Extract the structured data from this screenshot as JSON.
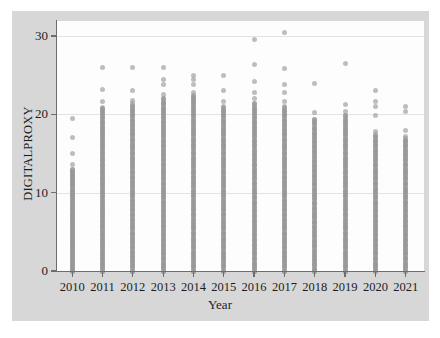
{
  "chart_data": {
    "type": "scatter",
    "title": "",
    "xlabel": "Year",
    "ylabel": "DIGITALPROXY",
    "xlim": [
      2009.5,
      2021.6
    ],
    "ylim": [
      -1.2,
      32.5
    ],
    "grid": true,
    "gridlines_y": [
      10,
      20,
      30
    ],
    "legend": "none",
    "x_tick_labels": [
      "2010",
      "2011",
      "2012",
      "2013",
      "2014",
      "2015",
      "2016",
      "2017",
      "2018",
      "2019",
      "2020",
      "2021"
    ],
    "y_tick_labels": [
      "0",
      "10",
      "20",
      "30"
    ],
    "y_ticks": [
      0,
      10,
      20,
      30
    ],
    "marker": {
      "shape": "circle",
      "color": "#969696",
      "opacity": 0.62,
      "size_px": 5
    },
    "background": {
      "figure": "#d7d7d7",
      "plot": "#fdfdfd",
      "axis": "#6d6d6d",
      "grid": "#e3e3e3"
    },
    "series": [
      {
        "name": "2010",
        "x": 2010,
        "dense_range": [
          0,
          13.0
        ],
        "values": [
          19.5,
          17.0,
          15.0,
          13.6,
          13.0,
          12.6,
          12.2,
          11.8,
          11.4,
          11.0,
          10.6,
          10.2,
          9.8,
          9.4,
          9.0,
          8.6,
          8.2,
          7.8,
          7.4,
          7.0,
          6.6,
          6.2,
          5.8,
          5.4,
          5.0,
          4.6,
          4.2,
          3.8,
          3.4,
          3.0,
          2.6,
          2.2,
          1.8,
          1.4,
          1.0,
          0.6,
          0.2,
          0.0
        ]
      },
      {
        "name": "2011",
        "x": 2011,
        "dense_range": [
          0,
          21.0
        ],
        "values": [
          26.0,
          23.2,
          21.6,
          20.8,
          20.2,
          19.6,
          19.0,
          18.5,
          18.0,
          17.5,
          17.0,
          16.5,
          16.0,
          15.5,
          15.0,
          14.5,
          14.0,
          13.5,
          13.0,
          12.5,
          12.0,
          11.5,
          11.0,
          10.5,
          10.0,
          9.5,
          9.0,
          8.5,
          8.0,
          7.5,
          7.0,
          6.5,
          6.0,
          5.5,
          5.0,
          4.5,
          4.0,
          3.5,
          3.0,
          2.5,
          2.0,
          1.5,
          1.0,
          0.5,
          0.0
        ]
      },
      {
        "name": "2012",
        "x": 2012,
        "dense_range": [
          0,
          21.5
        ],
        "values": [
          26.0,
          23.0,
          21.8,
          21.0,
          20.4,
          19.8,
          19.2,
          18.6,
          18.0,
          17.4,
          16.8,
          16.2,
          15.6,
          15.0,
          14.4,
          13.8,
          13.2,
          12.6,
          12.0,
          11.4,
          10.8,
          10.2,
          9.6,
          9.0,
          8.4,
          7.8,
          7.2,
          6.6,
          6.0,
          5.4,
          4.8,
          4.2,
          3.6,
          3.0,
          2.4,
          1.8,
          1.2,
          0.6,
          0.0
        ]
      },
      {
        "name": "2013",
        "x": 2013,
        "dense_range": [
          0,
          22.0
        ],
        "values": [
          26.0,
          24.4,
          23.8,
          22.6,
          22.0,
          21.4,
          20.8,
          20.2,
          19.6,
          19.0,
          18.4,
          17.8,
          17.2,
          16.6,
          16.0,
          15.4,
          14.8,
          14.2,
          13.6,
          13.0,
          12.4,
          11.8,
          11.2,
          10.6,
          10.0,
          9.4,
          8.8,
          8.2,
          7.6,
          7.0,
          6.4,
          5.8,
          5.2,
          4.6,
          4.0,
          3.4,
          2.8,
          2.2,
          1.6,
          1.0,
          0.4,
          0.0
        ]
      },
      {
        "name": "2014",
        "x": 2014,
        "dense_range": [
          0,
          22.5
        ],
        "values": [
          25.0,
          24.4,
          23.8,
          22.8,
          22.2,
          21.6,
          21.0,
          20.4,
          19.8,
          19.2,
          18.6,
          18.0,
          17.4,
          16.8,
          16.2,
          15.6,
          15.0,
          14.4,
          13.8,
          13.2,
          12.6,
          12.0,
          11.4,
          10.8,
          10.2,
          9.6,
          9.0,
          8.4,
          7.8,
          7.2,
          6.6,
          6.0,
          5.4,
          4.8,
          4.2,
          3.6,
          3.0,
          2.4,
          1.8,
          1.2,
          0.6,
          0.0
        ]
      },
      {
        "name": "2015",
        "x": 2015,
        "dense_range": [
          0,
          21.0
        ],
        "values": [
          25.0,
          23.0,
          21.6,
          21.0,
          20.4,
          19.8,
          19.2,
          18.6,
          18.0,
          17.4,
          16.8,
          16.2,
          15.6,
          15.0,
          14.4,
          13.8,
          13.2,
          12.6,
          12.0,
          11.4,
          10.8,
          10.2,
          9.6,
          9.0,
          8.4,
          7.8,
          7.2,
          6.6,
          6.0,
          5.4,
          4.8,
          4.2,
          3.6,
          3.0,
          2.4,
          1.8,
          1.2,
          0.6,
          0.0
        ]
      },
      {
        "name": "2016",
        "x": 2016,
        "dense_range": [
          0,
          21.5
        ],
        "values": [
          29.5,
          26.4,
          24.2,
          22.8,
          22.0,
          21.4,
          20.8,
          20.2,
          19.6,
          19.0,
          18.4,
          17.8,
          17.2,
          16.6,
          16.0,
          15.4,
          14.8,
          14.2,
          13.6,
          13.0,
          12.4,
          11.8,
          11.2,
          10.6,
          10.0,
          9.4,
          8.8,
          8.2,
          7.6,
          7.0,
          6.4,
          5.8,
          5.2,
          4.6,
          4.0,
          3.4,
          2.8,
          2.2,
          1.6,
          1.0,
          0.4,
          0.0
        ]
      },
      {
        "name": "2017",
        "x": 2017,
        "dense_range": [
          0,
          21.0
        ],
        "values": [
          30.5,
          25.8,
          23.8,
          22.8,
          21.6,
          21.0,
          20.4,
          19.8,
          19.2,
          18.6,
          18.0,
          17.4,
          16.8,
          16.2,
          15.6,
          15.0,
          14.4,
          13.8,
          13.2,
          12.6,
          12.0,
          11.4,
          10.8,
          10.2,
          9.6,
          9.0,
          8.4,
          7.8,
          7.2,
          6.6,
          6.0,
          5.4,
          4.8,
          4.2,
          3.6,
          3.0,
          2.4,
          1.8,
          1.2,
          0.6,
          0.0
        ]
      },
      {
        "name": "2018",
        "x": 2018,
        "dense_range": [
          0,
          19.5
        ],
        "values": [
          24.0,
          20.2,
          19.4,
          18.8,
          18.2,
          17.6,
          17.0,
          16.4,
          15.8,
          15.2,
          14.6,
          14.0,
          13.4,
          12.8,
          12.2,
          11.6,
          11.0,
          10.4,
          9.8,
          9.2,
          8.6,
          8.0,
          7.4,
          6.8,
          6.2,
          5.6,
          5.0,
          4.4,
          3.8,
          3.2,
          2.6,
          2.0,
          1.4,
          0.8,
          0.2,
          0.0
        ]
      },
      {
        "name": "2019",
        "x": 2019,
        "dense_range": [
          0,
          20.0
        ],
        "values": [
          26.5,
          21.2,
          20.4,
          19.8,
          19.2,
          18.6,
          18.0,
          17.4,
          16.8,
          16.2,
          15.6,
          15.0,
          14.4,
          13.8,
          13.2,
          12.6,
          12.0,
          11.4,
          10.8,
          10.2,
          9.6,
          9.0,
          8.4,
          7.8,
          7.2,
          6.6,
          6.0,
          5.4,
          4.8,
          4.2,
          3.6,
          3.0,
          2.4,
          1.8,
          1.2,
          0.6,
          0.0
        ]
      },
      {
        "name": "2020",
        "x": 2020,
        "dense_range": [
          0,
          17.5
        ],
        "values": [
          23.0,
          21.6,
          21.0,
          19.8,
          17.8,
          17.2,
          16.6,
          16.0,
          15.4,
          14.8,
          14.2,
          13.6,
          13.0,
          12.4,
          11.8,
          11.2,
          10.6,
          10.0,
          9.4,
          8.8,
          8.2,
          7.6,
          7.0,
          6.4,
          5.8,
          5.2,
          4.6,
          4.0,
          3.4,
          2.8,
          2.2,
          1.6,
          1.0,
          0.4,
          0.0
        ]
      },
      {
        "name": "2021",
        "x": 2021,
        "dense_range": [
          0,
          17.0
        ],
        "values": [
          21.0,
          20.4,
          18.0,
          17.2,
          16.6,
          16.0,
          15.4,
          14.8,
          14.2,
          13.6,
          13.0,
          12.4,
          11.8,
          11.2,
          10.6,
          10.0,
          9.4,
          8.8,
          8.2,
          7.6,
          7.0,
          6.4,
          5.8,
          5.2,
          4.6,
          4.0,
          3.4,
          2.8,
          2.2,
          1.6,
          1.0,
          0.4,
          0.0
        ]
      }
    ]
  }
}
